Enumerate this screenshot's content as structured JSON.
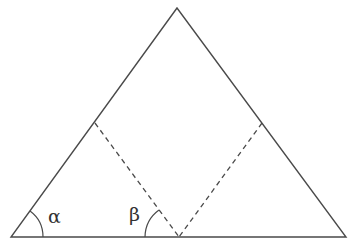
{
  "diagram": {
    "stroke_color": "#4a4a4a",
    "labels": {
      "alpha": "α",
      "beta": "β"
    },
    "points": {
      "apex": [
        177,
        8
      ],
      "left_base": [
        11,
        237
      ],
      "right_base": [
        346,
        237
      ],
      "base_mid": [
        179,
        237
      ],
      "left_side_point": [
        95,
        123
      ],
      "right_side_point": [
        262,
        123
      ]
    }
  }
}
